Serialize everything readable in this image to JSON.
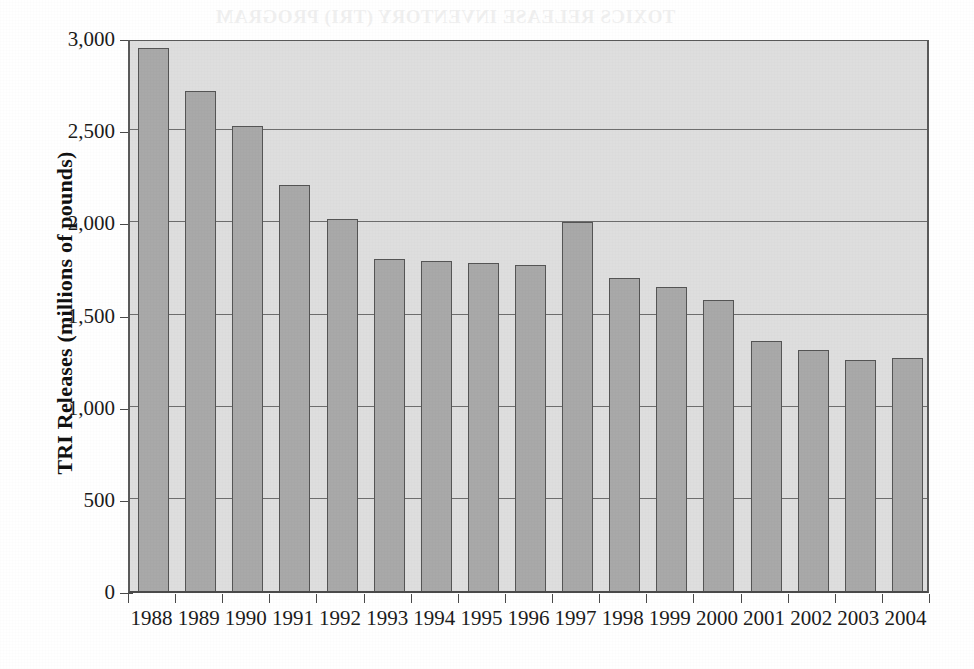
{
  "chart_data": {
    "type": "bar",
    "title": "",
    "xlabel": "",
    "ylabel": "TRI Releases (millions of pounds)",
    "categories": [
      "1988",
      "1989",
      "1990",
      "1991",
      "1992",
      "1993",
      "1994",
      "1995",
      "1996",
      "1997",
      "1998",
      "1999",
      "2000",
      "2001",
      "2002",
      "2003",
      "2004"
    ],
    "values": [
      2945,
      2715,
      2520,
      2200,
      2020,
      1800,
      1790,
      1780,
      1770,
      2000,
      1700,
      1650,
      1580,
      1355,
      1310,
      1255,
      1265
    ],
    "ylim": [
      0,
      3000
    ],
    "ytick_values": [
      0,
      500,
      1000,
      1500,
      2000,
      2500,
      3000
    ],
    "ytick_labels": [
      "0",
      "500",
      "1,000",
      "1,500",
      "2,000",
      "2,500",
      "3,000"
    ],
    "grid": true,
    "grid_axis": "y",
    "legend": "none",
    "bar_color": "#a9a9a9",
    "bar_border_color": "#555555",
    "plot_background_color": "#dedede",
    "axis_color": "#4a4a4a",
    "gridline_color": "#6e6e6e"
  },
  "axes": {
    "y_title": "TRI Releases (millions of pounds)"
  },
  "bleed_text": {
    "note": "faint mirrored show-through from the reverse of the printed page",
    "lines": [
      "TOXICS RELEASE INVENTORY (TRI) PROGRAM",
      "PERSISTENT, BIOACCUMULATIVE AND TOXIC (PBT)",
      "CHEMICALS, INCLUDING MERCURY",
      "number of chemicals and chemical categories reported",
      "and lower reporting thresholds for PBT chemicals",
      "releases and transfers of PBT chemicals",
      "and lower reporting thresholds"
    ]
  }
}
